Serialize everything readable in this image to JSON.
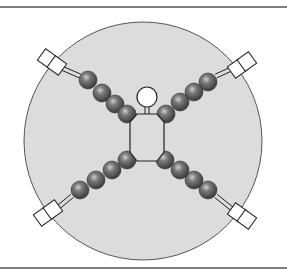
{
  "diagram": {
    "type": "schematic",
    "colors": {
      "background": "#ffffff",
      "rule_line": "#555555",
      "disc_fill": "#dcdcdc",
      "disc_stroke": "#555555",
      "bead_fill": "#6e6e6e",
      "bead_highlight": "#c8c8c8",
      "outline": "#222222"
    },
    "disc": {
      "cx": 143,
      "cy": 141,
      "r": 119
    },
    "top_rule_y": 7,
    "bottom_rule_y": 268,
    "body": {
      "head": {
        "cx": 147,
        "cy": 97,
        "r": 10
      },
      "points": "137,114 157,114 164,122 164,152 157,161 137,161 130,152 130,122"
    },
    "arms": [
      {
        "name": "upper-left",
        "beads": [
          [
            88,
            80
          ],
          [
            102,
            93
          ],
          [
            115,
            104
          ],
          [
            127,
            114
          ]
        ],
        "rod": [
          [
            57,
            66
          ],
          [
            80,
            76
          ]
        ],
        "box": {
          "x": 52,
          "y": 62,
          "angle": 36
        }
      },
      {
        "name": "upper-right",
        "beads": [
          [
            208,
            82
          ],
          [
            194,
            92
          ],
          [
            180,
            102
          ],
          [
            166,
            114
          ]
        ],
        "rod": [
          [
            216,
            76
          ],
          [
            238,
            66
          ]
        ],
        "box": {
          "x": 242,
          "y": 65,
          "angle": -36
        }
      },
      {
        "name": "lower-left",
        "beads": [
          [
            80,
            190
          ],
          [
            96,
            180
          ],
          [
            112,
            170
          ],
          [
            127,
            160
          ]
        ],
        "rod": [
          [
            55,
            210
          ],
          [
            72,
            196
          ]
        ],
        "box": {
          "x": 48,
          "y": 213,
          "angle": -36
        }
      },
      {
        "name": "lower-right",
        "beads": [
          [
            208,
            190
          ],
          [
            194,
            180
          ],
          [
            180,
            170
          ],
          [
            165,
            160
          ]
        ],
        "rod": [
          [
            216,
            196
          ],
          [
            236,
            212
          ]
        ],
        "box": {
          "x": 242,
          "y": 216,
          "angle": 36
        }
      }
    ]
  }
}
